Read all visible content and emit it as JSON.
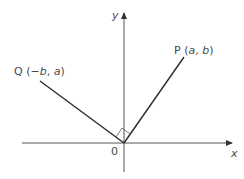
{
  "diagram": {
    "axes": {
      "x_label": "x",
      "y_label": "y",
      "origin_label": "0"
    },
    "points": [
      {
        "name": "P",
        "open": " (",
        "c1": "a",
        "sep": ", ",
        "c2": "b",
        "close": ")"
      },
      {
        "name": "Q",
        "open": " (",
        "c1": "−b",
        "sep": ", ",
        "c2": "a",
        "close": ")"
      }
    ],
    "right_angle_marker": true,
    "colors": {
      "line": "#2b2b2b",
      "axis": "#555555",
      "text": "#4a4a4a"
    }
  }
}
